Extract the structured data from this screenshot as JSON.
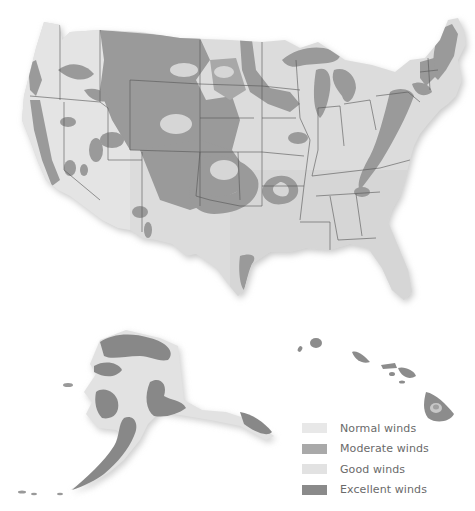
{
  "map": {
    "title": "",
    "regions": [
      "Contiguous United States",
      "Alaska",
      "Hawaii"
    ],
    "colors": {
      "land_base": "#d9d9d9",
      "normal": "#e6e6e6",
      "moderate": "#a6a6a6",
      "good": "#e0e0e0",
      "excellent": "#8c8c8c",
      "state_border": "#555555",
      "shadow": "#bdbdbd"
    }
  },
  "legend": {
    "items": [
      {
        "label": "Normal winds",
        "color": "#e8e8e8"
      },
      {
        "label": "Moderate winds",
        "color": "#a9a9a9"
      },
      {
        "label": "Good winds",
        "color": "#e2e2e2"
      },
      {
        "label": "Excellent winds",
        "color": "#8a8a8a"
      }
    ]
  }
}
